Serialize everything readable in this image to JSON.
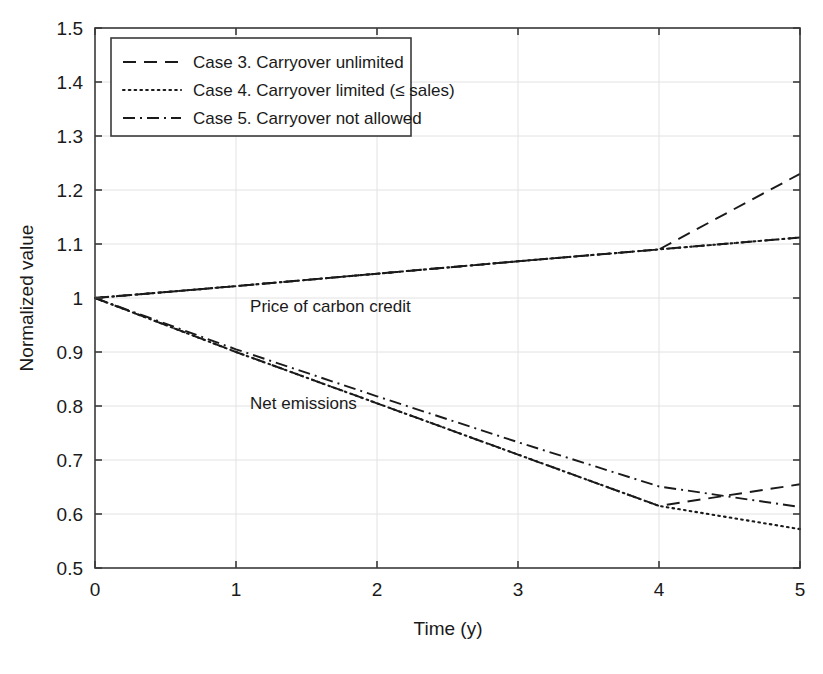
{
  "chart_data": {
    "type": "line",
    "title": "",
    "xlabel": "Time (y)",
    "ylabel": "Normalized value",
    "xlim": [
      0,
      5
    ],
    "ylim": [
      0.5,
      1.5
    ],
    "xticks": [
      "0",
      "1",
      "2",
      "3",
      "4",
      "5"
    ],
    "xtick_values": [
      0,
      1,
      2,
      3,
      4,
      5
    ],
    "yticks": [
      "0.5",
      "0.6",
      "0.7",
      "0.8",
      "0.9",
      "1",
      "1.1",
      "1.2",
      "1.3",
      "1.4",
      "1.5"
    ],
    "ytick_values": [
      0.5,
      0.6,
      0.7,
      0.8,
      0.9,
      1.0,
      1.1,
      1.2,
      1.3,
      1.4,
      1.5
    ],
    "grid": true,
    "legend_position": "upper left",
    "x": [
      0,
      1,
      2,
      3,
      4,
      5
    ],
    "groups": [
      {
        "name": "Price of carbon credit",
        "annotation": "Price of carbon credit",
        "annotation_x": 1.1,
        "annotation_y": 0.975,
        "series": [
          {
            "name": "Case 3. Carryover unlimited",
            "style": "dashed",
            "values": [
              1.0,
              1.022,
              1.045,
              1.068,
              1.09,
              1.23
            ]
          },
          {
            "name": "Case 4. Carryover limited (≤ sales)",
            "style": "dotted",
            "values": [
              1.0,
              1.022,
              1.045,
              1.068,
              1.09,
              1.112
            ]
          },
          {
            "name": "Case 5. Carryover not allowed",
            "style": "dashdot",
            "values": [
              1.0,
              1.022,
              1.045,
              1.068,
              1.09,
              1.112
            ]
          }
        ]
      },
      {
        "name": "Net emissions",
        "annotation": "Net emissions",
        "annotation_x": 1.1,
        "annotation_y": 0.795,
        "series": [
          {
            "name": "Case 3. Carryover unlimited",
            "style": "dashed",
            "values": [
              1.0,
              0.9,
              0.805,
              0.71,
              0.615,
              0.655
            ]
          },
          {
            "name": "Case 4. Carryover limited (≤ sales)",
            "style": "dotted",
            "values": [
              1.0,
              0.9,
              0.805,
              0.71,
              0.615,
              0.572
            ]
          },
          {
            "name": "Case 5. Carryover not allowed",
            "style": "dashdot",
            "values": [
              1.0,
              0.905,
              0.818,
              0.733,
              0.651,
              0.613
            ]
          }
        ]
      }
    ],
    "legend": [
      {
        "label": "Case 3. Carryover unlimited",
        "style": "dashed"
      },
      {
        "label": "Case 4. Carryover limited (≤ sales)",
        "style": "dotted"
      },
      {
        "label": "Case 5. Carryover not allowed",
        "style": "dashdot"
      }
    ],
    "annotations": [
      {
        "text": "Price of carbon credit",
        "x": 1.1,
        "y": 0.975
      },
      {
        "text": "Net emissions",
        "x": 1.1,
        "y": 0.795
      }
    ],
    "colors": {
      "line": "#1a1a1a",
      "axis": "#3a3a3a",
      "grid": "#e2e2e2",
      "background": "#ffffff"
    }
  },
  "background_text": {
    "note": "faint show-through text from reverse side of scanned page",
    "lines": [
      {
        "text": "sion, Cases 1 and 2 options are not considered in Chapter 5. Three Cases",
        "x": 120,
        "y": 8
      },
      {
        "text": "and the x-limits in the Table 5-1 are",
        "x": 400,
        "y": 26
      },
      {
        "text": "makes a business more profitable and sustainable to the",
        "x": 392,
        "y": 48
      },
      {
        "text": "by GHG Protocol Scope 1 and providing the conditions",
        "x": 392,
        "y": 70
      },
      {
        "text": "market for emission trading where the carbon price",
        "x": 400,
        "y": 92
      },
      {
        "text": "carbon tax. Therefore, a policy regulating the",
        "x": 400,
        "y": 114
      },
      {
        "text": "a key factor in emission reduction",
        "x": 400,
        "y": 136
      },
      {
        "text": "and the results are",
        "x": 400,
        "y": 158
      },
      {
        "text": "credits for the next",
        "x": 392,
        "y": 180
      },
      {
        "text": "Table 5-1 presented here",
        "x": 380,
        "y": 222
      },
      {
        "text": "and mitigation of carbon emissions",
        "x": 380,
        "y": 244
      },
      {
        "text": "the case studies",
        "x": 392,
        "y": 266
      },
      {
        "text": "the company can",
        "x": 560,
        "y": 288
      },
      {
        "text": "carbon credit",
        "x": 560,
        "y": 310
      }
    ]
  }
}
